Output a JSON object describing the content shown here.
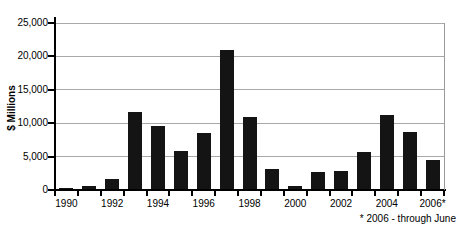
{
  "chart_data": {
    "type": "bar",
    "title": "",
    "xlabel": "",
    "ylabel": "$ Millions",
    "footnote": "* 2006 - through June",
    "ymax": 25000,
    "grid": "horizontal",
    "legend_position": "none",
    "bar_color": "#141414",
    "gridline_color": "#a9a9a9",
    "axis_color": "#000000",
    "x_label_interval": 2,
    "yticks": [
      {
        "value": 0,
        "label": "0"
      },
      {
        "value": 5000,
        "label": "5,000"
      },
      {
        "value": 10000,
        "label": "10,000"
      },
      {
        "value": 15000,
        "label": "15,000"
      },
      {
        "value": 20000,
        "label": "20,000"
      },
      {
        "value": 25000,
        "label": "25,000"
      }
    ],
    "categories": [
      "1990",
      "1991",
      "1992",
      "1993",
      "1994",
      "1995",
      "1996",
      "1997",
      "1998",
      "1999",
      "2000",
      "2001",
      "2002",
      "2003",
      "2004",
      "2005",
      "2006*"
    ],
    "values": [
      250,
      550,
      1600,
      11700,
      9600,
      5900,
      8600,
      21000,
      11000,
      3100,
      650,
      2700,
      2900,
      5700,
      11200,
      8700,
      4500
    ]
  }
}
